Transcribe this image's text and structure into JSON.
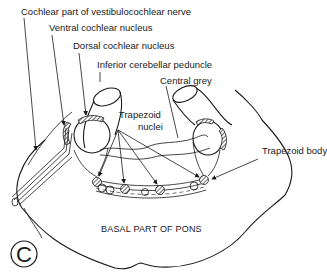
{
  "figure": {
    "panel_letter": "C",
    "labels": {
      "cochlear_nerve": "Cochlear part of vestibulocochlear nerve",
      "ventral_nucleus": "Ventral cochlear nucleus",
      "dorsal_nucleus": "Dorsal cochlear nucleus",
      "inferior_peduncle": "Inferior cerebellar peduncle",
      "central_grey": "Central grey",
      "trapezoid_nuclei_line1": "Trapezoid",
      "trapezoid_nuclei_line2": "nuclei",
      "trapezoid_body": "Trapezoid body",
      "basal_pons": "BASAL PART OF PONS"
    },
    "colors": {
      "line": "#1a1a1a",
      "background": "#ffffff"
    }
  }
}
